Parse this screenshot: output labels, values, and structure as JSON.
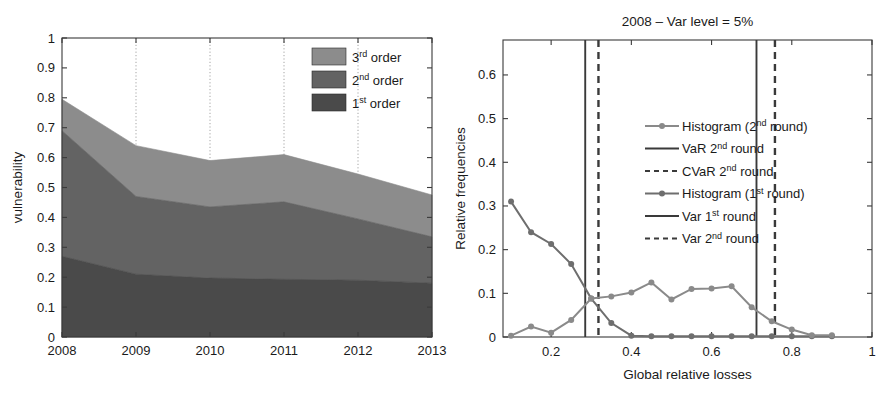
{
  "figure": {
    "panels": [
      "vulnerability-stacked-area",
      "relative-frequencies-histogram"
    ]
  },
  "chart_data": [
    {
      "type": "area",
      "id": "vulnerability-by-order",
      "title": "",
      "xlabel": "",
      "ylabel": "vulnerability",
      "categories": [
        "2008",
        "2009",
        "2010",
        "2011",
        "2012",
        "2013"
      ],
      "x": [
        2008,
        2009,
        2010,
        2011,
        2012,
        2013
      ],
      "xlim": [
        2008,
        2013
      ],
      "ylim": [
        0,
        1
      ],
      "yticks": [
        "0",
        "0.1",
        "0.2",
        "0.3",
        "0.4",
        "0.5",
        "0.6",
        "0.7",
        "0.8",
        "0.9",
        "1"
      ],
      "xticks": [
        "2008",
        "2009",
        "2010",
        "2011",
        "2012",
        "2013"
      ],
      "grid": "vertical-dotted",
      "stacked": true,
      "legend_position": "top-right",
      "series": [
        {
          "name": "1st order",
          "label_base": "1",
          "label_sup": "st",
          "label_tail": " order",
          "color": "#4a4a4a",
          "values": [
            0.27,
            0.21,
            0.197,
            0.193,
            0.19,
            0.18
          ]
        },
        {
          "name": "2nd order",
          "label_base": "2",
          "label_sup": "nd",
          "label_tail": " order",
          "color": "#636363",
          "values": [
            0.42,
            0.26,
            0.238,
            0.259,
            0.205,
            0.155
          ]
        },
        {
          "name": "3rd order",
          "label_base": "3",
          "label_sup": "rd",
          "label_tail": " order",
          "color": "#8c8c8c",
          "values": [
            0.105,
            0.17,
            0.155,
            0.158,
            0.15,
            0.14
          ]
        }
      ],
      "cumulative_tops": {
        "first_order": [
          0.27,
          0.21,
          0.197,
          0.193,
          0.19,
          0.18
        ],
        "second_order": [
          0.69,
          0.47,
          0.435,
          0.452,
          0.395,
          0.335
        ],
        "third_order": [
          0.795,
          0.64,
          0.59,
          0.61,
          0.545,
          0.475
        ]
      }
    },
    {
      "type": "line",
      "id": "global-relative-losses-histogram",
      "title": "2008 – Var level = 5%",
      "xlabel": "Global relative losses",
      "ylabel": "Relative frequencies",
      "xlim": [
        0.08,
        1.0
      ],
      "ylim": [
        0,
        0.68
      ],
      "xticks": [
        "0.2",
        "0.4",
        "0.6",
        "0.8",
        "1"
      ],
      "xtick_values": [
        0.2,
        0.4,
        0.6,
        0.8,
        1.0
      ],
      "yticks": [
        "0",
        "0.1",
        "0.2",
        "0.3",
        "0.4",
        "0.5",
        "0.6"
      ],
      "ytick_values": [
        0,
        0.1,
        0.2,
        0.3,
        0.4,
        0.5,
        0.6
      ],
      "grid": "none",
      "legend_position": "center-right",
      "series": [
        {
          "name": "Histogram (1st round)",
          "label_pre": "Histogram (1",
          "label_sup": "st",
          "label_post": " round)",
          "style": "line-marker",
          "color": "#6e6e6e",
          "x": [
            0.1,
            0.15,
            0.2,
            0.25,
            0.3,
            0.35,
            0.4,
            0.45,
            0.5,
            0.55,
            0.6,
            0.65,
            0.7,
            0.75,
            0.8,
            0.85,
            0.9
          ],
          "y": [
            0.31,
            0.24,
            0.213,
            0.167,
            0.088,
            0.032,
            0.003,
            0.002,
            0.002,
            0.002,
            0.002,
            0.002,
            0.002,
            0.002,
            0.002,
            0.002,
            0.002
          ]
        },
        {
          "name": "Histogram (2nd round)",
          "label_pre": "Histogram (2",
          "label_sup": "nd",
          "label_post": " round)",
          "style": "line-marker",
          "color": "#8a8a8a",
          "x": [
            0.1,
            0.15,
            0.2,
            0.25,
            0.3,
            0.35,
            0.4,
            0.45,
            0.5,
            0.55,
            0.6,
            0.65,
            0.7,
            0.75,
            0.8,
            0.85,
            0.9
          ],
          "y": [
            0.003,
            0.024,
            0.01,
            0.039,
            0.088,
            0.093,
            0.102,
            0.125,
            0.086,
            0.11,
            0.111,
            0.116,
            0.068,
            0.036,
            0.017,
            0.004,
            0.004
          ]
        }
      ],
      "reference_lines": [
        {
          "name": "VaR 2nd round",
          "label_pre": "VaR 2",
          "label_sup": "nd",
          "label_post": " round",
          "style": "solid",
          "color": "#3a3a3a",
          "x": 0.285
        },
        {
          "name": "CVaR 2nd round",
          "label_pre": "CVaR 2",
          "label_sup": "nd",
          "label_post": " round",
          "style": "dashed",
          "color": "#3a3a3a",
          "x": 0.318
        },
        {
          "name": "Var 1st round",
          "label_pre": "Var 1",
          "label_sup": "st",
          "label_post": " round",
          "style": "solid",
          "color": "#3a3a3a",
          "x": 0.712
        },
        {
          "name": "Var 2nd round",
          "label_pre": "Var 2",
          "label_sup": "nd",
          "label_post": " round",
          "style": "dashed",
          "color": "#3a3a3a",
          "x": 0.758
        }
      ],
      "legend_entries": [
        {
          "marker": "line-marker",
          "pre": "Histogram (2",
          "sup": "nd",
          "post": " round)",
          "color": "#8a8a8a"
        },
        {
          "marker": "solid",
          "pre": "VaR 2",
          "sup": "nd",
          "post": " round",
          "color": "#3a3a3a"
        },
        {
          "marker": "dashed",
          "pre": "CVaR 2",
          "sup": "nd",
          "post": " round",
          "color": "#3a3a3a"
        },
        {
          "marker": "line-marker",
          "pre": "Histogram (1",
          "sup": "st",
          "post": " round)",
          "color": "#6e6e6e"
        },
        {
          "marker": "solid",
          "pre": "Var 1",
          "sup": "st",
          "post": " round",
          "color": "#3a3a3a"
        },
        {
          "marker": "dashed",
          "pre": "Var 2",
          "sup": "nd",
          "post": " round",
          "color": "#3a3a3a"
        }
      ]
    }
  ]
}
